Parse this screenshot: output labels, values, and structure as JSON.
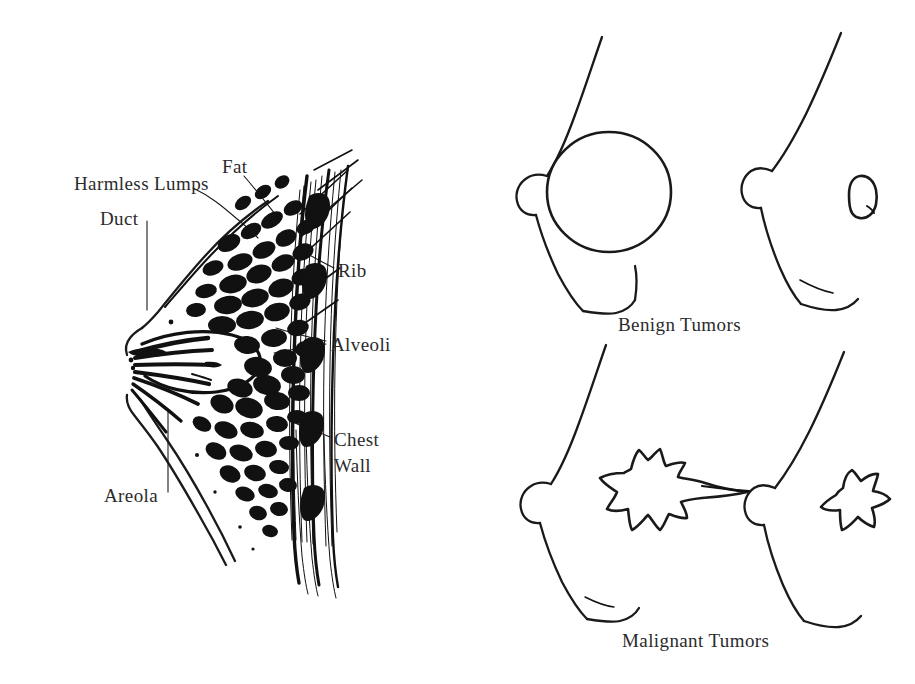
{
  "figure": {
    "background_color": "#ffffff",
    "ink_color": "#111111",
    "text_color": "#2b2b2b"
  },
  "anatomy_diagram": {
    "name": "breast-cross-section",
    "labels": [
      {
        "id": "harmless-lumps",
        "text": "Harmless Lumps",
        "x": 74,
        "y": 184
      },
      {
        "id": "duct",
        "text": "Duct",
        "x": 100,
        "y": 219
      },
      {
        "id": "fat",
        "text": "Fat",
        "x": 222,
        "y": 167
      },
      {
        "id": "rib",
        "text": "Rib",
        "x": 338,
        "y": 271
      },
      {
        "id": "alveoli",
        "text": "Alveoli",
        "x": 331,
        "y": 345
      },
      {
        "id": "chest-wall-1",
        "text": "Chest",
        "x": 334,
        "y": 440
      },
      {
        "id": "chest-wall-2",
        "text": "Wall",
        "x": 334,
        "y": 466
      },
      {
        "id": "areola",
        "text": "Areola",
        "x": 104,
        "y": 496
      }
    ]
  },
  "tumor_diagram": {
    "name": "tumor-comparison",
    "captions": [
      {
        "id": "benign-tumors",
        "text": "Benign Tumors",
        "x": 618,
        "y": 325
      },
      {
        "id": "malignant-tumors",
        "text": "Malignant Tumors",
        "x": 622,
        "y": 641
      }
    ],
    "panels": [
      {
        "id": "benign-large",
        "type": "benign",
        "shape": "round",
        "row": "top",
        "column": "left"
      },
      {
        "id": "benign-small",
        "type": "benign",
        "shape": "oval",
        "row": "top",
        "column": "right"
      },
      {
        "id": "malignant-large",
        "type": "malignant",
        "shape": "spiculated",
        "row": "bottom",
        "column": "left"
      },
      {
        "id": "malignant-small",
        "type": "malignant",
        "shape": "star",
        "row": "bottom",
        "column": "right"
      }
    ]
  }
}
